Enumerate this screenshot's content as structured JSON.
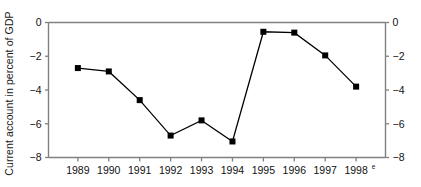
{
  "chart_data": {
    "type": "line",
    "title": "",
    "subtitle": "",
    "xlabel": "",
    "ylabel": "Current account in percent of GDP",
    "categories": [
      "1989",
      "1990",
      "1991",
      "1992",
      "1993",
      "1994",
      "1995",
      "1996",
      "1997",
      "1998"
    ],
    "x_tick_labels": [
      "1989",
      "1990",
      "1991",
      "1992",
      "1993",
      "1994",
      "1995",
      "1996",
      "1997",
      "1998"
    ],
    "x_tick_superscripts": [
      "",
      "",
      "",
      "",
      "",
      "",
      "",
      "",
      "",
      "e"
    ],
    "values": [
      -2.7,
      -2.9,
      -4.6,
      -6.7,
      -5.8,
      -7.05,
      -0.55,
      -0.6,
      -1.95,
      -3.8
    ],
    "series": [
      {
        "name": "Current account",
        "values": [
          -2.7,
          -2.9,
          -4.6,
          -6.7,
          -5.8,
          -7.05,
          -0.55,
          -0.6,
          -1.95,
          -3.8
        ]
      }
    ],
    "ylim": [
      -8,
      0
    ],
    "y_ticks": [
      0,
      -2,
      -4,
      -6,
      -8
    ],
    "y_tick_labels_left": [
      "0",
      "−2",
      "−4",
      "−6",
      "−8"
    ],
    "y_tick_labels_right": [
      "0",
      "−2",
      "−4",
      "−6",
      "−8"
    ],
    "grid": false,
    "legend": false,
    "legend_position": "none",
    "right_axis_mirrored": true,
    "marker": "square",
    "colors": {
      "line": "#000000",
      "marker": "#000000",
      "frame": "#808080",
      "tick": "#808080",
      "text": "#111111",
      "background": "#ffffff"
    }
  }
}
